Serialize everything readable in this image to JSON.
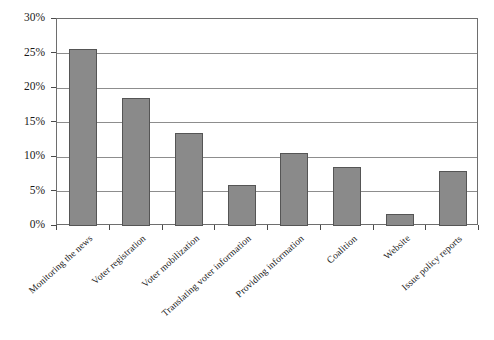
{
  "chart_data": {
    "type": "bar",
    "title": "",
    "subtitle": "",
    "xlabel": "",
    "ylabel": "",
    "categories": [
      "Monitoring the news",
      "Voter registration",
      "Voter mobilization",
      "Translating voter information",
      "Providing information",
      "Coalition",
      "Website",
      "Issue policy reports"
    ],
    "values": [
      25.6,
      18.6,
      13.5,
      6.0,
      10.6,
      8.5,
      1.7,
      8.0
    ],
    "value_unit": "%",
    "ylim": [
      0,
      30
    ],
    "ytick_values": [
      0,
      5,
      10,
      15,
      20,
      25,
      30
    ],
    "ytick_labels": [
      "0%",
      "5%",
      "10%",
      "15%",
      "20%",
      "25%",
      "30%"
    ],
    "grid": true,
    "grid_axis": "y",
    "legend": false,
    "legend_position": "none",
    "bar_color": "#8a8a8a",
    "bar_border_color": "#555555",
    "grid_color": "#8d8d8d",
    "axis_color": "#6e6e6e",
    "text_color": "#1a1a1a",
    "background_color": "#ffffff",
    "x_label_rotation": -42
  }
}
